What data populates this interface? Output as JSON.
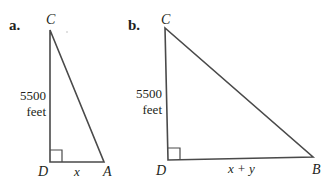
{
  "figures": [
    {
      "part_label": "a.",
      "vertices": {
        "top": "C",
        "right_angle": "D",
        "bottom_right": "A"
      },
      "vertical_side": {
        "value": "5500",
        "unit": "feet"
      },
      "horizontal_side": "x",
      "right_angle_at": "D"
    },
    {
      "part_label": "b.",
      "vertices": {
        "top": "C",
        "right_angle": "D",
        "bottom_right": "B"
      },
      "vertical_side": {
        "value": "5500",
        "unit": "feet"
      },
      "horizontal_side": "x + y",
      "right_angle_at": "D"
    }
  ],
  "colors": {
    "line": "#4a4a4a",
    "text": "#231f20",
    "background": "#ffffff"
  }
}
